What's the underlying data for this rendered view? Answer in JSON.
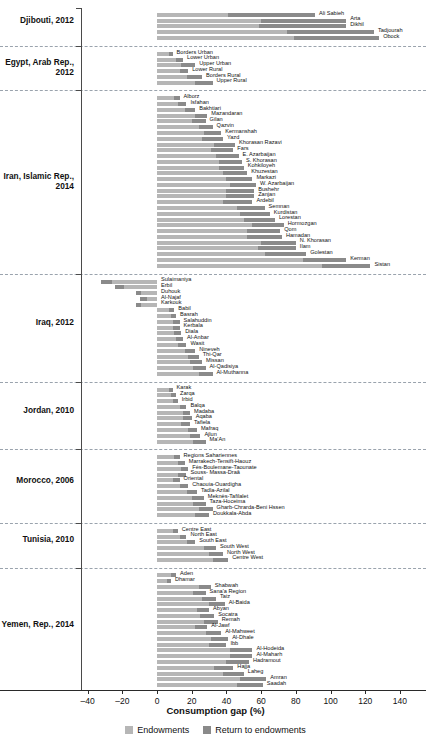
{
  "chart_data": {
    "type": "bar",
    "orientation": "horizontal",
    "stacked": true,
    "title": "",
    "xlabel": "Consumption gap (%)",
    "ylabel": "",
    "xlim": [
      -40,
      155
    ],
    "xticks": [
      -40,
      -20,
      0,
      20,
      40,
      60,
      80,
      100,
      120,
      140
    ],
    "xticklabels": [
      "–40",
      "–20",
      "0",
      "20",
      "40",
      "60",
      "80",
      "100",
      "120",
      "140"
    ],
    "grid": false,
    "legend_position": "bottom",
    "series": [
      {
        "name": "Endowments",
        "color": "#b6b6b6"
      },
      {
        "name": "Return to endowments",
        "color": "#8a8a8a"
      }
    ],
    "groups": [
      {
        "label": "Djibouti, 2012",
        "categories": [
          "Ali Sabieh",
          "Arta",
          "Dikhil",
          "Tadjourah",
          "Obock"
        ],
        "endowments": [
          41,
          60,
          59,
          75,
          79
        ],
        "return_to_endowments": [
          50,
          49,
          50,
          50,
          49
        ],
        "totals": [
          91,
          109,
          109,
          125,
          128
        ]
      },
      {
        "label": "Egypt, Arab Rep., 2012",
        "categories": [
          "Borders Urban",
          "Lower Urban",
          "Upper Urban",
          "Lower Rural",
          "Borders Rural",
          "Upper Rural"
        ],
        "endowments": [
          7,
          11,
          14,
          13,
          17,
          22
        ],
        "return_to_endowments": [
          2,
          4,
          8,
          5,
          9,
          10
        ],
        "totals": [
          9,
          15,
          22,
          18,
          26,
          32
        ]
      },
      {
        "label": "Iran, Islamic Rep., 2014",
        "categories": [
          "Alborz",
          "Isfahan",
          "Bakhtiari",
          "Mazandaran",
          "Gilan",
          "Qazvin",
          "Kermanshah",
          "Yazd",
          "Khorasan Razavi",
          "Fars",
          "E. Azarbaijan",
          "S. Khorasan",
          "Kohkiloyeh",
          "Khuzestan",
          "Markazi",
          "W. Azarbaijan",
          "Bushehr",
          "Zanjan",
          "Ardebil",
          "Semnan",
          "Kurdistan",
          "Lorestan",
          "Hormozgan",
          "Qom",
          "Hamadan",
          "N. Khorasan",
          "Ilam",
          "Golestan",
          "Kerman",
          "Sistan"
        ],
        "endowments": [
          10,
          12,
          16,
          22,
          20,
          24,
          27,
          26,
          33,
          31,
          34,
          36,
          36,
          38,
          40,
          42,
          40,
          40,
          38,
          46,
          48,
          50,
          55,
          52,
          52,
          60,
          58,
          62,
          84,
          95
        ],
        "return_to_endowments": [
          3,
          5,
          6,
          7,
          8,
          8,
          10,
          12,
          12,
          13,
          13,
          13,
          14,
          14,
          15,
          15,
          16,
          16,
          17,
          16,
          17,
          18,
          18,
          19,
          20,
          20,
          22,
          24,
          25,
          28
        ],
        "totals": [
          13,
          17,
          22,
          29,
          28,
          32,
          37,
          38,
          45,
          44,
          47,
          49,
          50,
          52,
          55,
          57,
          56,
          56,
          55,
          62,
          65,
          68,
          73,
          71,
          72,
          80,
          80,
          86,
          109,
          123
        ]
      },
      {
        "label": "Iraq, 2012",
        "categories": [
          "Sulaimaniya",
          "Erbil",
          "Duhouk",
          "Al-Najaf",
          "Karkouk",
          "Babil",
          "Basrah",
          "Salahuddin",
          "Kerbala",
          "Diala",
          "Al-Anbar",
          "Wasit",
          "Nineveh",
          "Thi-Qar",
          "Missan",
          "Al-Qadisiya",
          "Al-Muthanna"
        ],
        "endowments": [
          -26,
          -19,
          -9,
          -6,
          -9,
          7,
          8,
          9,
          9,
          10,
          11,
          12,
          16,
          18,
          19,
          21,
          24
        ],
        "return_to_endowments": [
          -6,
          -5,
          -3,
          -4,
          -3,
          3,
          3,
          4,
          4,
          4,
          4,
          5,
          6,
          6,
          7,
          7,
          8
        ],
        "totals": [
          -32,
          -24,
          -12,
          -10,
          -12,
          10,
          11,
          13,
          13,
          14,
          15,
          17,
          22,
          24,
          26,
          28,
          32
        ]
      },
      {
        "label": "Jordan, 2010",
        "categories": [
          "Karak",
          "Zarqa",
          "Irbid",
          "Balqa",
          "Madaba",
          "Aqaba",
          "Tafiela",
          "Mafraq",
          "Ajlun",
          "Ma'An"
        ],
        "endowments": [
          7,
          8,
          9,
          13,
          15,
          15,
          14,
          18,
          19,
          21
        ],
        "return_to_endowments": [
          2,
          3,
          3,
          4,
          4,
          5,
          5,
          5,
          6,
          7
        ],
        "totals": [
          9,
          11,
          12,
          17,
          19,
          20,
          19,
          23,
          25,
          28
        ]
      },
      {
        "label": "Morocco, 2006",
        "categories": [
          "Regions Sahariennes",
          "Marrakech-Tensift-Haouz",
          "Fès-Boulemane-Taounate",
          "Souss- Massa-Draâ",
          "Oriental",
          "Chaouia-Ouardigha",
          "Tadla-Azilal",
          "Meknès-Tafilalet",
          "Taza-Hoceima",
          "Gharb-Chrarda-Beni Hssen",
          "Doukkala-Abda"
        ],
        "endowments": [
          10,
          12,
          14,
          12,
          9,
          13,
          17,
          20,
          21,
          24,
          22
        ],
        "return_to_endowments": [
          3,
          4,
          4,
          5,
          4,
          5,
          6,
          7,
          7,
          8,
          8
        ],
        "totals": [
          13,
          16,
          18,
          17,
          13,
          18,
          23,
          27,
          28,
          32,
          30
        ]
      },
      {
        "label": "Tunisia, 2010",
        "categories": [
          "Centre East",
          "North East",
          "South East",
          "South West",
          "North West",
          "Centre West"
        ],
        "endowments": [
          9,
          13,
          17,
          27,
          30,
          32
        ],
        "return_to_endowments": [
          3,
          4,
          5,
          7,
          8,
          9
        ],
        "totals": [
          12,
          17,
          22,
          34,
          38,
          41
        ]
      },
      {
        "label": "Yemen, Rep., 2014",
        "categories": [
          "Aden",
          "Dhamar",
          "Shabwah",
          "Sana'a Region",
          "Taiz",
          "Al-Baida",
          "Abyan",
          "Socatra",
          "Remah",
          "Al-Jawf",
          "Al-Mahweet",
          "Al-Dhale",
          "Ibb",
          "Al-Hodeida",
          "Al-Maharh",
          "Hadramout",
          "Hajja",
          "Laheg",
          "Amran",
          "Saadah"
        ],
        "endowments": [
          8,
          6,
          24,
          21,
          26,
          30,
          23,
          25,
          27,
          22,
          28,
          31,
          30,
          42,
          42,
          40,
          33,
          38,
          48,
          46
        ],
        "return_to_endowments": [
          3,
          2,
          7,
          7,
          8,
          9,
          7,
          8,
          8,
          7,
          9,
          10,
          10,
          13,
          13,
          13,
          11,
          12,
          15,
          15
        ],
        "totals": [
          11,
          8,
          31,
          28,
          34,
          39,
          30,
          33,
          35,
          29,
          37,
          41,
          40,
          55,
          55,
          53,
          44,
          50,
          63,
          61
        ]
      }
    ]
  },
  "legend": {
    "items": [
      {
        "label": "Endowments",
        "color": "#b6b6b6"
      },
      {
        "label": "Return to endowments",
        "color": "#8a8a8a"
      }
    ]
  }
}
